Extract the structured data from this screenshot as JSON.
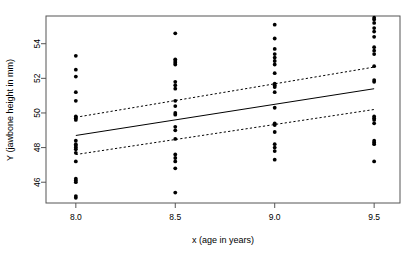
{
  "chart_data": {
    "type": "scatter",
    "title": "",
    "xlabel": "x (age in years)",
    "ylabel": "Y (jawbone height in mm)",
    "xlim": [
      7.85,
      9.63
    ],
    "ylim": [
      44.8,
      55.6
    ],
    "xticks": [
      8.0,
      8.5,
      9.0,
      9.5
    ],
    "xticklabels": [
      "8.0",
      "8.5",
      "9.0",
      "9.5"
    ],
    "yticks": [
      46,
      48,
      50,
      52,
      54
    ],
    "yticklabels": [
      "46",
      "48",
      "50",
      "52",
      "54"
    ],
    "grid": false,
    "legend": null,
    "point_color": "#000000",
    "line_color": "#000000",
    "frame_color": "#555555",
    "series": [
      {
        "name": "observations",
        "marker": "filled-circle",
        "x": [
          8.0,
          8.0,
          8.0,
          8.0,
          8.0,
          8.0,
          8.0,
          8.0,
          8.0,
          8.0,
          8.0,
          8.0,
          8.0,
          8.0,
          8.0,
          8.0,
          8.0,
          8.0,
          8.0,
          8.0,
          8.5,
          8.5,
          8.5,
          8.5,
          8.5,
          8.5,
          8.5,
          8.5,
          8.5,
          8.5,
          8.5,
          8.5,
          8.5,
          8.5,
          8.5,
          8.5,
          8.5,
          8.5,
          8.5,
          8.5,
          9.0,
          9.0,
          9.0,
          9.0,
          9.0,
          9.0,
          9.0,
          9.0,
          9.0,
          9.0,
          9.0,
          9.0,
          9.0,
          9.0,
          9.0,
          9.0,
          9.0,
          9.0,
          9.0,
          9.0,
          9.5,
          9.5,
          9.5,
          9.5,
          9.5,
          9.5,
          9.5,
          9.5,
          9.5,
          9.5,
          9.5,
          9.5,
          9.5,
          9.5,
          9.5,
          9.5,
          9.5,
          9.5,
          9.5,
          9.5
        ],
        "y": [
          53.3,
          52.5,
          52.1,
          51.2,
          50.7,
          49.8,
          49.7,
          49.6,
          48.4,
          48.2,
          48.1,
          48.0,
          47.9,
          47.7,
          47.2,
          46.2,
          46.1,
          46.0,
          45.2,
          45.1,
          54.6,
          53.1,
          53.0,
          52.9,
          52.8,
          51.8,
          51.6,
          51.4,
          50.7,
          50.4,
          50.0,
          49.9,
          49.2,
          49.0,
          48.5,
          47.6,
          47.4,
          47.2,
          46.8,
          45.4,
          55.1,
          54.3,
          53.7,
          53.4,
          53.2,
          53.0,
          52.8,
          52.3,
          51.7,
          51.6,
          51.5,
          51.2,
          50.3,
          49.4,
          49.3,
          48.9,
          48.2,
          48.0,
          47.8,
          47.3,
          55.5,
          55.4,
          55.2,
          54.9,
          54.7,
          54.4,
          53.8,
          53.6,
          53.4,
          52.7,
          51.9,
          51.8,
          49.8,
          49.7,
          49.6,
          49.4,
          48.4,
          48.3,
          48.2,
          47.2
        ]
      }
    ],
    "fit_line": {
      "name": "least-squares regression line",
      "style": "solid",
      "x": [
        8.0,
        9.5
      ],
      "y": [
        48.7,
        51.4
      ],
      "slope": 1.8,
      "intercept": 34.3
    },
    "confidence_bands": [
      {
        "name": "upper confidence band",
        "style": "dashed",
        "x": [
          8.0,
          9.5
        ],
        "y": [
          49.75,
          52.65
        ]
      },
      {
        "name": "lower confidence band",
        "style": "dashed",
        "x": [
          8.0,
          9.5
        ],
        "y": [
          47.6,
          50.2
        ]
      }
    ]
  }
}
